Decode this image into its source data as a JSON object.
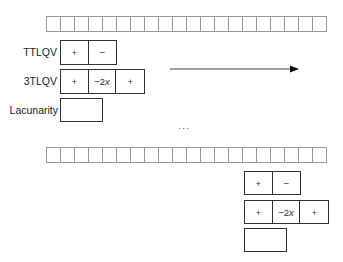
{
  "diagram": {
    "top": {
      "strip": {
        "cell_count": 20
      },
      "rows": [
        {
          "label": "TTLQV",
          "cells": [
            "+",
            "−"
          ]
        },
        {
          "label": "3TLQV",
          "cells": [
            "+",
            "−2",
            "+"
          ],
          "middle_suffix_italic": "x"
        },
        {
          "label": "Lacunarity",
          "cells": []
        }
      ]
    },
    "arrow": {
      "direction": "right"
    },
    "ellipsis": "···",
    "bottom": {
      "strip": {
        "cell_count": 20
      },
      "rows": [
        {
          "cells": [
            "+",
            "−"
          ]
        },
        {
          "cells": [
            "+",
            "−2",
            "+"
          ],
          "middle_suffix_italic": "x"
        },
        {
          "cells": []
        }
      ]
    }
  }
}
